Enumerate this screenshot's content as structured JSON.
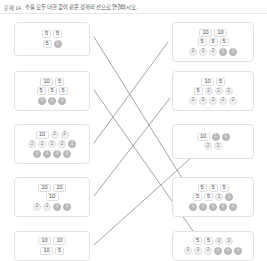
{
  "header": {
    "number": "문제 14",
    "instruction": "수를 모두 더한 값이 같은 것끼리 선으로 연결하시오."
  },
  "chip_kinds": {
    "ten": "10",
    "five": "5",
    "two": "2",
    "one": "1"
  },
  "left_cards": [
    {
      "id": "left-card-1",
      "x": 14,
      "y": 22,
      "w": 76,
      "h": 34,
      "rows": [
        [
          {
            "t": "sq",
            "v": "5"
          },
          {
            "t": "sq",
            "v": "5"
          }
        ],
        [
          {
            "t": "sq",
            "v": "5"
          },
          {
            "t": "c1",
            "v": "1"
          }
        ]
      ]
    },
    {
      "id": "left-card-2",
      "x": 14,
      "y": 71,
      "w": 76,
      "h": 40,
      "rows": [
        [
          {
            "t": "sq10",
            "v": "10"
          },
          {
            "t": "sq",
            "v": "5"
          }
        ],
        [
          {
            "t": "sq",
            "v": "5"
          },
          {
            "t": "sq",
            "v": "5"
          },
          {
            "t": "sq",
            "v": "5"
          }
        ],
        [
          {
            "t": "c1",
            "v": "1"
          },
          {
            "t": "c1",
            "v": "1"
          },
          {
            "t": "c1",
            "v": "1"
          }
        ]
      ]
    },
    {
      "id": "left-card-3",
      "x": 14,
      "y": 124,
      "w": 76,
      "h": 40,
      "rows": [
        [
          {
            "t": "sq10",
            "v": "10"
          },
          {
            "t": "c2",
            "v": "2"
          },
          {
            "t": "c2",
            "v": "2"
          }
        ],
        [
          {
            "t": "c2",
            "v": "2"
          },
          {
            "t": "c2",
            "v": "2"
          },
          {
            "t": "c2",
            "v": "2"
          },
          {
            "t": "c2",
            "v": "2"
          },
          {
            "t": "c1",
            "v": "1"
          }
        ],
        [
          {
            "t": "c1",
            "v": "1"
          },
          {
            "t": "c1",
            "v": "1"
          },
          {
            "t": "c1",
            "v": "1"
          },
          {
            "t": "c1",
            "v": "1"
          }
        ]
      ]
    },
    {
      "id": "left-card-4",
      "x": 14,
      "y": 177,
      "w": 76,
      "h": 40,
      "rows": [
        [
          {
            "t": "sq10",
            "v": "10"
          },
          {
            "t": "sq10",
            "v": "10"
          }
        ],
        [
          {
            "t": "sq10",
            "v": "10"
          }
        ],
        [
          {
            "t": "c2",
            "v": "2"
          },
          {
            "t": "c2",
            "v": "2"
          },
          {
            "t": "c1",
            "v": "1"
          },
          {
            "t": "c1",
            "v": "1"
          }
        ]
      ]
    },
    {
      "id": "left-card-5",
      "x": 14,
      "y": 231,
      "w": 76,
      "h": 30,
      "rows": [
        [
          {
            "t": "sq10",
            "v": "10"
          },
          {
            "t": "sq10",
            "v": "10"
          }
        ],
        [
          {
            "t": "sq10",
            "v": "10"
          },
          {
            "t": "sq",
            "v": "5"
          }
        ]
      ]
    }
  ],
  "right_cards": [
    {
      "id": "right-card-1",
      "x": 172,
      "y": 22,
      "w": 82,
      "h": 40,
      "rows": [
        [
          {
            "t": "sq10",
            "v": "10"
          },
          {
            "t": "sq10",
            "v": "10"
          }
        ],
        [
          {
            "t": "sq",
            "v": "5"
          },
          {
            "t": "sq",
            "v": "5"
          },
          {
            "t": "sq",
            "v": "5"
          }
        ],
        [
          {
            "t": "c2",
            "v": "2"
          },
          {
            "t": "c2",
            "v": "2"
          },
          {
            "t": "c2",
            "v": "2"
          },
          {
            "t": "c1",
            "v": "1"
          },
          {
            "t": "c1",
            "v": "1"
          }
        ]
      ]
    },
    {
      "id": "right-card-2",
      "x": 172,
      "y": 71,
      "w": 82,
      "h": 40,
      "rows": [
        [
          {
            "t": "sq10",
            "v": "10"
          },
          {
            "t": "sq",
            "v": "5"
          }
        ],
        [
          {
            "t": "sq",
            "v": "5"
          },
          {
            "t": "c2",
            "v": "2"
          },
          {
            "t": "c2",
            "v": "2"
          },
          {
            "t": "c2",
            "v": "2"
          }
        ],
        [
          {
            "t": "c2",
            "v": "2"
          },
          {
            "t": "c2",
            "v": "2"
          },
          {
            "t": "c2",
            "v": "2"
          },
          {
            "t": "c2",
            "v": "2"
          },
          {
            "t": "c2",
            "v": "2"
          }
        ]
      ]
    },
    {
      "id": "right-card-3",
      "x": 172,
      "y": 124,
      "w": 82,
      "h": 35,
      "rows": [
        [
          {
            "t": "sq10",
            "v": "10"
          },
          {
            "t": "c1",
            "v": "1"
          },
          {
            "t": "c1",
            "v": "1"
          }
        ],
        [
          {
            "t": "c2",
            "v": "2"
          },
          {
            "t": "c2",
            "v": "2"
          }
        ]
      ]
    },
    {
      "id": "right-card-4",
      "x": 172,
      "y": 177,
      "w": 82,
      "h": 40,
      "rows": [
        [
          {
            "t": "sq",
            "v": "5"
          },
          {
            "t": "sq",
            "v": "5"
          },
          {
            "t": "sq",
            "v": "5"
          }
        ],
        [
          {
            "t": "sq",
            "v": "5"
          },
          {
            "t": "sq",
            "v": "5"
          },
          {
            "t": "c2",
            "v": "2"
          },
          {
            "t": "c1",
            "v": "1"
          }
        ],
        [
          {
            "t": "c1",
            "v": "1"
          },
          {
            "t": "c1",
            "v": "1"
          },
          {
            "t": "c1",
            "v": "1"
          },
          {
            "t": "c1",
            "v": "1"
          },
          {
            "t": "c1",
            "v": "1"
          }
        ]
      ]
    },
    {
      "id": "right-card-5",
      "x": 172,
      "y": 231,
      "w": 82,
      "h": 30,
      "rows": [
        [
          {
            "t": "sq",
            "v": "5"
          },
          {
            "t": "sq",
            "v": "5"
          },
          {
            "t": "c2",
            "v": "2"
          },
          {
            "t": "c2",
            "v": "2"
          }
        ],
        [
          {
            "t": "c2",
            "v": "2"
          },
          {
            "t": "c2",
            "v": "2"
          },
          {
            "t": "c2",
            "v": "2"
          },
          {
            "t": "c1",
            "v": "1"
          },
          {
            "t": "c1",
            "v": "1"
          },
          {
            "t": "c1",
            "v": "1"
          }
        ]
      ]
    }
  ],
  "connector_lines": [
    {
      "id": "line-1",
      "x1": 94,
      "y1": 37,
      "x2": 205,
      "y2": 215,
      "color": "#9a9a9e"
    },
    {
      "id": "line-2",
      "x1": 94,
      "y1": 90,
      "x2": 212,
      "y2": 258,
      "color": "#9a9a9e"
    },
    {
      "id": "line-3",
      "x1": 94,
      "y1": 143,
      "x2": 168,
      "y2": 42,
      "color": "#9a9a9e"
    },
    {
      "id": "line-4",
      "x1": 94,
      "y1": 196,
      "x2": 170,
      "y2": 98,
      "color": "#9a9a9e"
    },
    {
      "id": "line-5",
      "x1": 94,
      "y1": 245,
      "x2": 202,
      "y2": 148,
      "color": "#9a9a9e"
    }
  ],
  "style": {
    "card_border": "#e2e2e5",
    "chip_fill": "#fbfbfc",
    "coin2_fill": "#f0f0f2",
    "coin1_fill": "#bcbcbf",
    "line_color": "#9a9a9e"
  }
}
